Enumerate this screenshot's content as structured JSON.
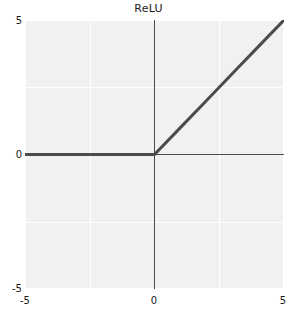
{
  "chart_data": {
    "type": "line",
    "title": "ReLU",
    "xlabel": "",
    "ylabel": "",
    "xlim": [
      -5,
      5
    ],
    "ylim": [
      -5,
      5
    ],
    "grid": true,
    "legend": null,
    "xticks": [
      -5,
      0,
      5
    ],
    "xticklabels": [
      "-5",
      "0",
      "5"
    ],
    "yticks": [
      -5,
      0,
      5
    ],
    "yticklabels": [
      "-5",
      "0",
      "5"
    ],
    "gridlines_x": [
      -5,
      -2.5,
      0,
      2.5,
      5
    ],
    "gridlines_y": [
      -5,
      -2.5,
      0,
      2.5,
      5
    ],
    "series": [
      {
        "name": "ReLU",
        "color": "#4b4b4b",
        "linewidth": 3,
        "x": [
          -5,
          -4,
          -3,
          -2,
          -1,
          0,
          1,
          2,
          3,
          4,
          5
        ],
        "values": [
          0,
          0,
          0,
          0,
          0,
          0,
          1,
          2,
          3,
          4,
          5
        ]
      }
    ],
    "axis_lines": {
      "x_axis_at": 0,
      "y_axis_at": 0,
      "color": "#4b4b4b"
    },
    "colors": {
      "plot_background": "#f1f1f1",
      "figure_background": "#ffffff",
      "gridline": "#ffffff",
      "curve": "#4b4b4b",
      "text": "#1a1a1a"
    }
  },
  "axis": {
    "y_top_label": "5",
    "y_zero_label": "0",
    "y_bottom_label": "-5",
    "x_left_label": "-5",
    "x_zero_label": "0",
    "x_right_label": "5"
  },
  "title": {
    "text": "ReLU"
  }
}
